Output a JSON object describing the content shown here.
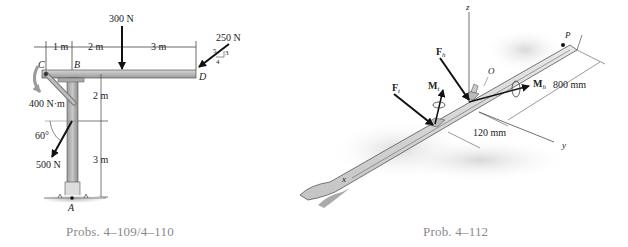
{
  "figures": [
    {
      "id": "frame",
      "caption": "Probs. 4–109/4–110",
      "points": {
        "A": "A",
        "B": "B",
        "C": "C",
        "D": "D"
      },
      "dimensions": {
        "cb": "1 m",
        "b_load": "2 m",
        "load_d": "3 m",
        "upper_col": "2 m",
        "lower_col": "3 m"
      },
      "loads": {
        "vertical_force": "300 N",
        "inclined_force": "250 N",
        "slope": {
          "hyp": "5",
          "rise": "3",
          "run": "4"
        },
        "couple_moment": "400 N·m",
        "angled_force": "500 N",
        "angle": "60°"
      }
    },
    {
      "id": "ski",
      "caption": "Prob. 4–112",
      "axes": {
        "x": "x",
        "y": "y",
        "z": "z"
      },
      "points": {
        "O": "O",
        "P": "P"
      },
      "labels": {
        "Ft_main": "F",
        "Ft_sub": "t",
        "Fh_main": "F",
        "Fh_sub": "h",
        "Mt_main": "M",
        "Mt_sub": "t",
        "Mh_main": "M",
        "Mh_sub": "h"
      },
      "dimensions": {
        "length": "800 mm",
        "offset": "120 mm"
      }
    }
  ]
}
